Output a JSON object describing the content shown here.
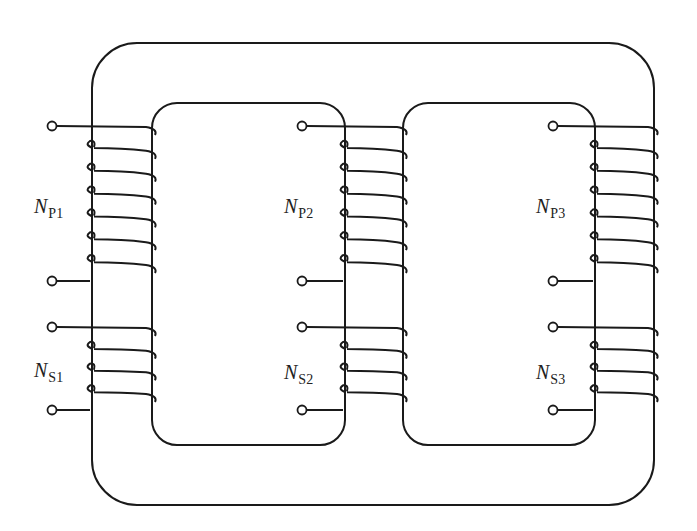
{
  "diagram": {
    "type": "three-phase-core-type-transformer",
    "stroke_color": "#1a1a1a",
    "background": "#ffffff",
    "core": {
      "outer": {
        "x": 92,
        "y": 43,
        "w": 562,
        "h": 462,
        "r": 45
      },
      "windows": [
        {
          "x": 152,
          "y": 103,
          "w": 193,
          "h": 342,
          "r": 25
        },
        {
          "x": 403,
          "y": 103,
          "w": 192,
          "h": 342,
          "r": 25
        }
      ]
    },
    "limbs": [
      {
        "name": "limb-1",
        "x1": 92,
        "x2": 152,
        "primary": {
          "label_n": "N",
          "label_sub": "P1",
          "turns": 7,
          "term_top_y": 126,
          "term_bot_y": 281,
          "term_x": 52
        },
        "secondary": {
          "label_n": "N",
          "label_sub": "S1",
          "turns": 4,
          "term_top_y": 327,
          "term_bot_y": 410,
          "term_x": 52
        }
      },
      {
        "name": "limb-2",
        "x1": 345,
        "x2": 403,
        "primary": {
          "label_n": "N",
          "label_sub": "P2",
          "turns": 7,
          "term_top_y": 126,
          "term_bot_y": 281,
          "term_x": 302
        },
        "secondary": {
          "label_n": "N",
          "label_sub": "S2",
          "turns": 4,
          "term_top_y": 327,
          "term_bot_y": 410,
          "term_x": 302
        }
      },
      {
        "name": "limb-3",
        "x1": 595,
        "x2": 654,
        "primary": {
          "label_n": "N",
          "label_sub": "P3",
          "turns": 7,
          "term_top_y": 126,
          "term_bot_y": 281,
          "term_x": 553
        },
        "secondary": {
          "label_n": "N",
          "label_sub": "S3",
          "turns": 4,
          "term_top_y": 327,
          "term_bot_y": 410,
          "term_x": 553
        }
      }
    ],
    "labels": [
      {
        "id": "NP1",
        "n": "N",
        "sub": "P1",
        "x": 34,
        "y": 196
      },
      {
        "id": "NS1",
        "n": "N",
        "sub": "S1",
        "x": 34,
        "y": 360
      },
      {
        "id": "NP2",
        "n": "N",
        "sub": "P2",
        "x": 284,
        "y": 196
      },
      {
        "id": "NS2",
        "n": "N",
        "sub": "S2",
        "x": 284,
        "y": 362
      },
      {
        "id": "NP3",
        "n": "N",
        "sub": "P3",
        "x": 536,
        "y": 196
      },
      {
        "id": "NS3",
        "n": "N",
        "sub": "S3",
        "x": 536,
        "y": 362
      }
    ]
  }
}
